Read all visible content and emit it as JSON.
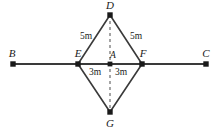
{
  "figure": {
    "type": "geometry-diagram",
    "width": 214,
    "height": 131,
    "background_color": "#ffffff",
    "stroke_color": "#3a3a3a",
    "text_color": "#1a1a1a"
  },
  "points": {
    "B": {
      "label": "B",
      "x": 13,
      "y": 64,
      "label_x": 12,
      "label_y": 53,
      "dot": true
    },
    "C": {
      "label": "C",
      "x": 206,
      "y": 64,
      "label_x": 206,
      "label_y": 53,
      "dot": true
    },
    "D": {
      "label": "D",
      "x": 110,
      "y": 15,
      "label_x": 110,
      "label_y": 5,
      "dot": true
    },
    "E": {
      "label": "E",
      "x": 78,
      "y": 64,
      "label_x": 78,
      "label_y": 53,
      "dot": true
    },
    "F": {
      "label": "F",
      "x": 142,
      "y": 64,
      "label_x": 143,
      "label_y": 53,
      "dot": true
    },
    "G": {
      "label": "G",
      "x": 110,
      "y": 112,
      "label_x": 110,
      "label_y": 123,
      "dot": true
    },
    "A": {
      "label": "A",
      "x": 110,
      "y": 64,
      "label_x": 113,
      "label_y": 55,
      "dot": true
    }
  },
  "segments": {
    "baseline": {
      "name": "BC",
      "from": "B",
      "to": "C",
      "style": "solid"
    },
    "DE": {
      "name": "DE",
      "from": "D",
      "to": "E",
      "style": "solid"
    },
    "DF": {
      "name": "DF",
      "from": "D",
      "to": "F",
      "style": "solid"
    },
    "EG": {
      "name": "EG",
      "from": "E",
      "to": "G",
      "style": "solid"
    },
    "FG": {
      "name": "FG",
      "from": "F",
      "to": "G",
      "style": "solid"
    },
    "DG": {
      "name": "DG",
      "from": "D",
      "to": "G",
      "style": "dashed"
    }
  },
  "measurements": [
    {
      "id": "de-length",
      "text": "5m",
      "x": 86,
      "y": 36,
      "side": "DE"
    },
    {
      "id": "df-length",
      "text": "5m",
      "x": 136,
      "y": 36,
      "side": "DF"
    },
    {
      "id": "ea-length",
      "text": "3m",
      "x": 95,
      "y": 72,
      "side": "EA"
    },
    {
      "id": "af-length",
      "text": "3m",
      "x": 121,
      "y": 72,
      "side": "AF"
    }
  ]
}
